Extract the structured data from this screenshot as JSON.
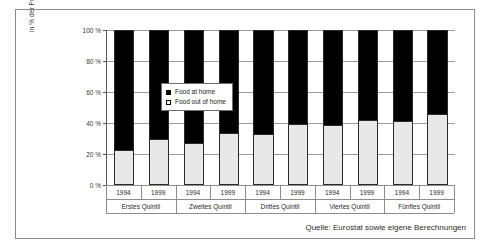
{
  "chart_data": {
    "type": "bar",
    "title": "",
    "subtitle": "",
    "xlabel": "",
    "ylabel": "in % der Foodausgaben total",
    "ylim": [
      0,
      100
    ],
    "grid": true,
    "stacked": true,
    "stack_total": 100,
    "legend_position": "inside-upper-left",
    "categories": [
      "Erstes Quintil 1994",
      "Erstes Quintil 1999",
      "Zweites Quintil 1994",
      "Zweites Quintil 1999",
      "Drittes Quintil 1994",
      "Drittes Quintil 1999",
      "Viertes Quintil 1994",
      "Viertes Quintil 1999",
      "Fünftes Quintil 1994",
      "Fünftes Quintil 1999"
    ],
    "groups": [
      {
        "label": "Erstes Quintil",
        "years": [
          "1994",
          "1999"
        ]
      },
      {
        "label": "Zweites Quintil",
        "years": [
          "1994",
          "1999"
        ]
      },
      {
        "label": "Drittes Quintil",
        "years": [
          "1994",
          "1999"
        ]
      },
      {
        "label": "Viertes Quintil",
        "years": [
          "1994",
          "1999"
        ]
      },
      {
        "label": "Fünftes Quintil",
        "years": [
          "1994",
          "1999"
        ]
      }
    ],
    "series": [
      {
        "name": "Food out of home",
        "color": "#e8e8e8",
        "values": [
          22,
          29,
          26.5,
          33,
          32,
          38.5,
          38,
          41.5,
          40.5,
          45
        ]
      },
      {
        "name": "Food at home",
        "color": "#000000",
        "values": [
          78,
          71,
          73.5,
          67,
          68,
          61.5,
          62,
          58.5,
          59.5,
          55
        ]
      }
    ],
    "yticks": [
      {
        "value": 0,
        "label": "0 %"
      },
      {
        "value": 20,
        "label": "20 %"
      },
      {
        "value": 40,
        "label": "40 %"
      },
      {
        "value": 60,
        "label": "60 %"
      },
      {
        "value": 80,
        "label": "80 %"
      },
      {
        "value": 100,
        "label": "100 %"
      }
    ],
    "legend": [
      {
        "label": "Food at home",
        "swatch": "filled"
      },
      {
        "label": "Food out of home",
        "swatch": "hollow"
      }
    ],
    "source": "Quelle: Eurostat sowie eigene Berechnungen"
  }
}
